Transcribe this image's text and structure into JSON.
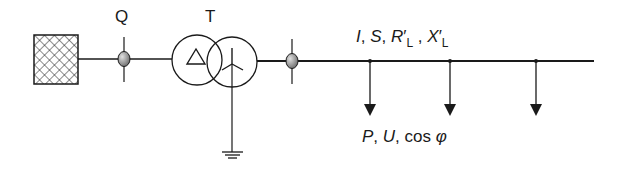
{
  "diagram": {
    "type": "single-line electrical network diagram",
    "components": {
      "source": {
        "symbol": "hatched-network-feeder"
      },
      "breaker_q": {
        "label": "Q"
      },
      "transformer": {
        "label": "T",
        "primary_winding": "delta",
        "secondary_winding": "star-grounded"
      },
      "breaker_2": {
        "label": ""
      },
      "line": {
        "label_parts": {
          "i": "I",
          "sep1": ", ",
          "s": "S",
          "sep2": ", ",
          "r": "R",
          "r_prime": "′",
          "r_sub": "L",
          "sep3": " , ",
          "x": "X",
          "x_prime": "′",
          "x_sub": "L"
        }
      },
      "loads": {
        "count": 3,
        "label_parts": {
          "p": "P",
          "sep1": ", ",
          "u": "U",
          "sep2": ", ",
          "cos": "cos ",
          "phi": "φ"
        }
      }
    },
    "colors": {
      "stroke": "#1a1a1a",
      "breaker_fill_light": "#d9d9d9",
      "breaker_fill_dark": "#6e6e6e"
    }
  }
}
